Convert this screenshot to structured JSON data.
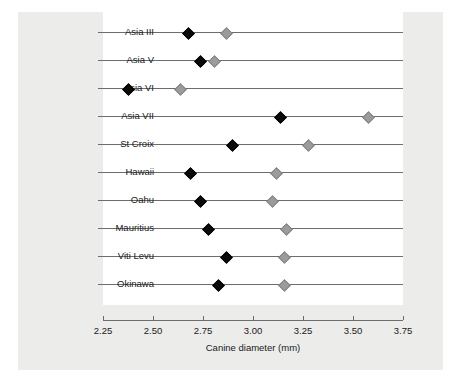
{
  "chart_data": {
    "type": "scatter",
    "title": "",
    "xlabel": "Canine diameter (mm)",
    "ylabel": "",
    "xlim": [
      2.25,
      3.75
    ],
    "xticks": [
      "2.25",
      "2.50",
      "2.75",
      "3.00",
      "3.25",
      "3.50",
      "3.75"
    ],
    "xtick_values": [
      2.25,
      2.5,
      2.75,
      3.0,
      3.25,
      3.5,
      3.75
    ],
    "grid": false,
    "legend": "none",
    "categories": [
      "Asia III",
      "Asia V",
      "Asia VI",
      "Asia VII",
      "St Croix",
      "Hawaii",
      "Oahu",
      "Mauritius",
      "Viti Levu",
      "Okinawa"
    ],
    "series": [
      {
        "name": "dark",
        "color": "#0a0a0a",
        "marker": "filled-diamond",
        "values": [
          2.67,
          2.73,
          2.37,
          3.13,
          2.89,
          2.68,
          2.73,
          2.77,
          2.86,
          2.82
        ]
      },
      {
        "name": "light",
        "color": "#9b9b9b",
        "marker": "filled-diamond",
        "values": [
          2.86,
          2.8,
          2.63,
          3.57,
          3.27,
          3.11,
          3.09,
          3.16,
          3.15,
          3.15
        ]
      }
    ],
    "colors": {
      "panel_background": "#ececeb",
      "plot_background": "#ffffff",
      "axis": "#6d6d6d",
      "text": "#1a1a1a"
    }
  }
}
